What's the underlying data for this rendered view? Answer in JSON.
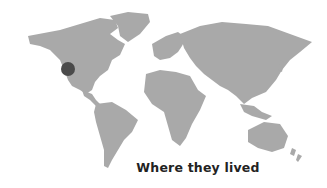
{
  "map": {
    "land_color": "#a9a9a9",
    "background": "#ffffff",
    "marker": {
      "label": "location-marker",
      "color": "#4a4a4a",
      "region": "US West Coast"
    }
  },
  "caption": "Where they lived"
}
